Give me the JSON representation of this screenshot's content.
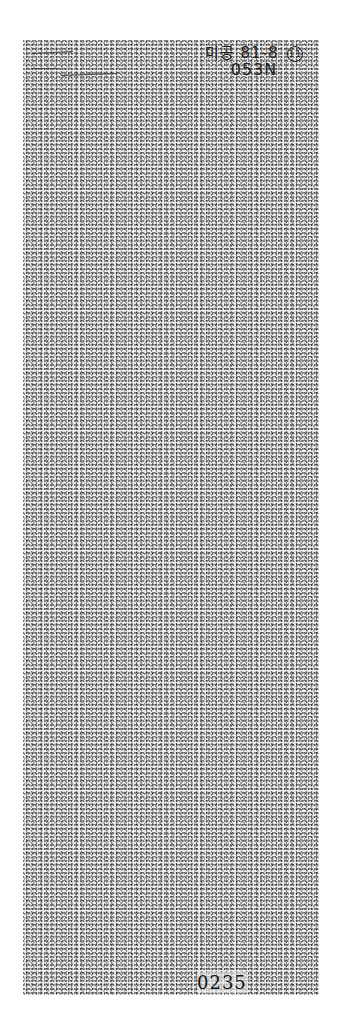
{
  "document": {
    "type": "scanned-microfilm-page",
    "annotation_top_right": {
      "code": "미공 81-8",
      "circled_number": "11",
      "subcode": "053N"
    },
    "page_number": "0235",
    "top_left_marks": "illegible handwritten marks",
    "colors": {
      "background": "#ffffff",
      "sheet": "#ececec",
      "ink": "#222222"
    }
  }
}
